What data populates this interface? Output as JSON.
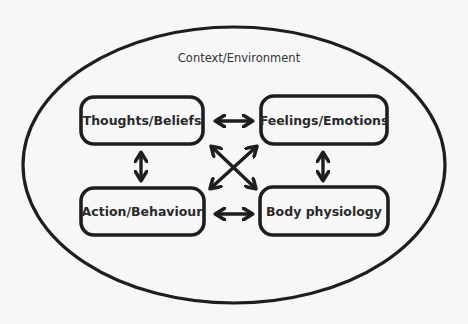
{
  "diagram": {
    "context_label": "Context/Environment",
    "nodes": [
      {
        "id": "thoughts",
        "label": "Thoughts/Beliefs"
      },
      {
        "id": "feelings",
        "label": "Feelings/Emotions"
      },
      {
        "id": "action",
        "label": "Action/Behaviour"
      },
      {
        "id": "body",
        "label": "Body physiology"
      }
    ],
    "edges": [
      {
        "from": "thoughts",
        "to": "feelings",
        "type": "bidirectional"
      },
      {
        "from": "action",
        "to": "body",
        "type": "bidirectional"
      },
      {
        "from": "thoughts",
        "to": "action",
        "type": "bidirectional"
      },
      {
        "from": "feelings",
        "to": "body",
        "type": "bidirectional"
      },
      {
        "from": "thoughts",
        "to": "body",
        "type": "bidirectional"
      },
      {
        "from": "feelings",
        "to": "action",
        "type": "bidirectional"
      }
    ],
    "stroke_color": "#1e1e1e",
    "background": "#f7f7f7"
  }
}
